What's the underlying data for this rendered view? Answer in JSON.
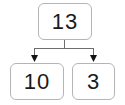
{
  "diagram": {
    "type": "number-bond-decomposition",
    "whole": {
      "value": "13",
      "role": "whole"
    },
    "parts": [
      {
        "value": "10",
        "role": "part",
        "position": "left"
      },
      {
        "value": "3",
        "role": "part",
        "position": "right"
      }
    ],
    "connectors": {
      "style": "elbow-with-arrowheads",
      "arrow_count": 2,
      "arrow_direction": "down"
    },
    "colors": {
      "background": "#ffffff",
      "box_border": "#b5b5b5",
      "box_fill": "#ffffff",
      "text": "#1a1a1a",
      "connector_line": "#6e6e6e",
      "arrowhead": "#111111"
    }
  }
}
